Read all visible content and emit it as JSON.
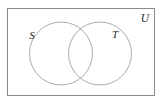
{
  "diagram": {
    "type": "venn-two-set",
    "background_color": "#ffffff",
    "universe": {
      "label": "U",
      "label_x": 141,
      "label_y": 22,
      "rect": {
        "x": 7.5,
        "y": 8.5,
        "width": 147,
        "height": 87
      },
      "stroke_color": "#8a8a8a",
      "fill_color": "#ffffff"
    },
    "sets": [
      {
        "name": "set-s",
        "label": "S",
        "label_x": 32,
        "label_y": 39,
        "cx": 61,
        "cy": 53.5,
        "r": 31.5,
        "stroke_color": "#a2a2a2"
      },
      {
        "name": "set-t",
        "label": "T",
        "label_x": 112,
        "label_y": 38,
        "cx": 100,
        "cy": 53.5,
        "r": 31.5,
        "stroke_color": "#a2a2a2"
      }
    ]
  }
}
